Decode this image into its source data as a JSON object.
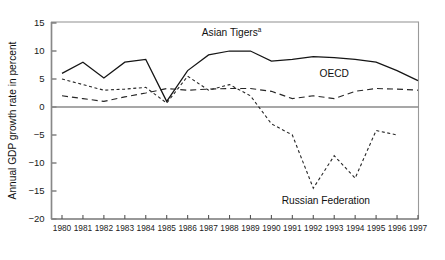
{
  "chart_data": {
    "type": "line",
    "title": "",
    "xlabel": "",
    "ylabel": "Annual GDP growth rate in percent",
    "ylim": [
      -20,
      15
    ],
    "ytick_step": 5,
    "yticks": [
      "15",
      "10",
      "5",
      "0",
      "−5",
      "−10",
      "−15",
      "−20"
    ],
    "ytick_values": [
      15,
      10,
      5,
      0,
      -5,
      -10,
      -15,
      -20
    ],
    "grid": false,
    "zero_line": true,
    "legend": "inline-annotations",
    "categories": [
      "1980",
      "1981",
      "1982",
      "1983",
      "1984",
      "1985",
      "1986",
      "1987",
      "1988",
      "1989",
      "1990",
      "1991",
      "1992",
      "1993",
      "1994",
      "1995",
      "1996",
      "1997"
    ],
    "x": [
      1980,
      1981,
      1982,
      1983,
      1984,
      1985,
      1986,
      1987,
      1988,
      1989,
      1990,
      1991,
      1992,
      1993,
      1994,
      1995,
      1996,
      1997
    ],
    "series": [
      {
        "name": "Asian Tigers",
        "label": "Asian Tigers",
        "label_superscript": "a",
        "style": "solid",
        "color": "#151515",
        "label_x": 1988.1,
        "label_y": 12.6,
        "values": [
          6.0,
          8.0,
          5.2,
          8.0,
          8.5,
          1.0,
          6.5,
          9.3,
          10.0,
          10.0,
          8.2,
          8.5,
          9.0,
          8.8,
          8.5,
          8.0,
          6.5,
          4.7
        ]
      },
      {
        "name": "OECD",
        "label": "OECD",
        "label_superscript": "",
        "style": "long-dash",
        "color": "#262626",
        "label_x": 1993.0,
        "label_y": 5.3,
        "values": [
          2.0,
          1.5,
          1.0,
          1.8,
          2.5,
          3.3,
          3.0,
          3.2,
          3.3,
          3.3,
          2.8,
          1.5,
          2.0,
          1.5,
          2.8,
          3.3,
          3.2,
          3.0
        ]
      },
      {
        "name": "Russian Federation",
        "label": "Russian Federation",
        "label_superscript": "",
        "style": "short-dash",
        "color": "#262626",
        "label_x": 1992.6,
        "label_y": -17.3,
        "values": [
          5.0,
          4.0,
          3.0,
          3.2,
          3.5,
          0.7,
          5.5,
          3.0,
          4.0,
          2.0,
          -3.0,
          -5.0,
          -14.5,
          -8.7,
          -12.7,
          -4.2,
          -5.0,
          null
        ]
      }
    ]
  }
}
